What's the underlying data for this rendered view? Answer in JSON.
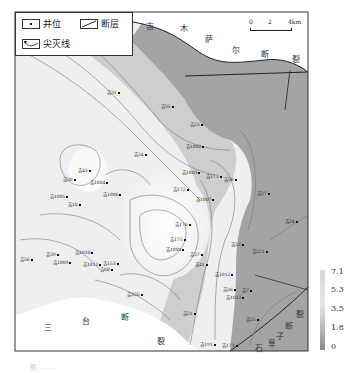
{
  "legend": {
    "well": "井位",
    "fault": "断层",
    "pinchout": "尖灭线"
  },
  "scale_bar": {
    "ticks": [
      "0",
      "2",
      "4km"
    ]
  },
  "fault_labels": {
    "north": [
      "吉",
      "木",
      "萨",
      "尔",
      "断",
      "裂"
    ],
    "south": [
      "三",
      "台",
      "断",
      "裂"
    ],
    "southeast": [
      "裂",
      "断",
      "子",
      "阜",
      "石"
    ]
  },
  "colorbar": {
    "ticks": [
      "7.1",
      "5.3",
      "3.5",
      "1.8",
      "0"
    ],
    "colors": {
      "high": "#d8d8d8",
      "mid": "#f0f0f0",
      "low": "#8a8a8a"
    }
  },
  "wells": [
    {
      "name": "吉31",
      "x": 117,
      "y": 93
    },
    {
      "name": "吉35",
      "x": 171,
      "y": 107
    },
    {
      "name": "吉23",
      "x": 200,
      "y": 125
    },
    {
      "name": "吉1002",
      "x": 196,
      "y": 147
    },
    {
      "name": "吉34",
      "x": 144,
      "y": 155
    },
    {
      "name": "吉43",
      "x": 88,
      "y": 171
    },
    {
      "name": "吉1003",
      "x": 192,
      "y": 173
    },
    {
      "name": "吉173",
      "x": 216,
      "y": 177
    },
    {
      "name": "吉30",
      "x": 73,
      "y": 180
    },
    {
      "name": "吉1004",
      "x": 100,
      "y": 183
    },
    {
      "name": "吉38",
      "x": 234,
      "y": 180
    },
    {
      "name": "吉27",
      "x": 267,
      "y": 194
    },
    {
      "name": "吉1005",
      "x": 60,
      "y": 197
    },
    {
      "name": "吉18",
      "x": 78,
      "y": 205
    },
    {
      "name": "吉1006",
      "x": 113,
      "y": 195
    },
    {
      "name": "吉172",
      "x": 183,
      "y": 190
    },
    {
      "name": "吉1007",
      "x": 206,
      "y": 200
    },
    {
      "name": "吉24",
      "x": 295,
      "y": 222
    },
    {
      "name": "吉176",
      "x": 185,
      "y": 225
    },
    {
      "name": "吉175",
      "x": 180,
      "y": 240
    },
    {
      "name": "吉22",
      "x": 241,
      "y": 245
    },
    {
      "name": "吉221",
      "x": 262,
      "y": 252
    },
    {
      "name": "吉1008",
      "x": 176,
      "y": 250
    },
    {
      "name": "吉39",
      "x": 56,
      "y": 255
    },
    {
      "name": "吉1009",
      "x": 63,
      "y": 263
    },
    {
      "name": "吉1010",
      "x": 85,
      "y": 253
    },
    {
      "name": "吉153",
      "x": 113,
      "y": 264
    },
    {
      "name": "吉1011",
      "x": 93,
      "y": 265
    },
    {
      "name": "吉60",
      "x": 110,
      "y": 270
    },
    {
      "name": "吉41",
      "x": 205,
      "y": 265
    },
    {
      "name": "吉37",
      "x": 200,
      "y": 255
    },
    {
      "name": "吉1012",
      "x": 225,
      "y": 275
    },
    {
      "name": "吉26",
      "x": 233,
      "y": 290
    },
    {
      "name": "吉1013",
      "x": 236,
      "y": 298
    },
    {
      "name": "吉7",
      "x": 252,
      "y": 291
    },
    {
      "name": "吉56",
      "x": 30,
      "y": 260
    },
    {
      "name": "吉35b",
      "x": 137,
      "y": 295
    },
    {
      "name": "吉21",
      "x": 193,
      "y": 314
    },
    {
      "name": "吉25",
      "x": 256,
      "y": 320
    },
    {
      "name": "吉191",
      "x": 210,
      "y": 345
    },
    {
      "name": "吉171",
      "x": 232,
      "y": 346
    }
  ],
  "caption": "图 ……"
}
